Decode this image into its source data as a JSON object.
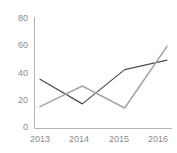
{
  "chart_data": {
    "type": "line",
    "title": "",
    "xlabel": "",
    "ylabel": "",
    "categories": [
      "2013",
      "2014",
      "2015",
      "2016"
    ],
    "series": [
      {
        "name": "series-1",
        "color": "#4d4d4d",
        "values": [
          36,
          18,
          43,
          50
        ]
      },
      {
        "name": "series-2",
        "color": "#a6a6a6",
        "values": [
          16,
          31,
          15,
          60
        ]
      }
    ],
    "ylim": [
      0,
      80
    ],
    "yticks": [
      0,
      20,
      40,
      60,
      80
    ],
    "ytick_labels": [
      "0",
      "20",
      "40",
      "60",
      "80"
    ],
    "xtick_labels": [
      "2013",
      "2014",
      "2015",
      "2016"
    ],
    "grid": false,
    "legend": "none",
    "axis_color": "#b3b3b3",
    "tick_label_color": "#8c8c8c",
    "background": "#ffffff"
  }
}
